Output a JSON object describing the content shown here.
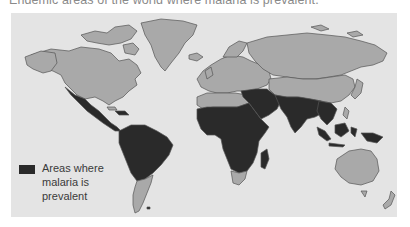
{
  "caption": "Endemic areas of the world where malaria is prevalent.",
  "map": {
    "colors": {
      "ocean": "#e4e4e4",
      "land": "#a9a9a9",
      "border": "#555555",
      "malaria": "#2a2a2a"
    },
    "prevalent_regions": [
      "Mexico",
      "Central America",
      "Northern South America",
      "Sub-Saharan Africa",
      "Madagascar",
      "Middle East",
      "South Asia",
      "Southeast Asia",
      "Indonesia",
      "Papua New Guinea"
    ]
  },
  "legend": {
    "swatch_color": "#2a2a2a",
    "lines": [
      "Areas where",
      "malaria is",
      "prevalent"
    ]
  }
}
